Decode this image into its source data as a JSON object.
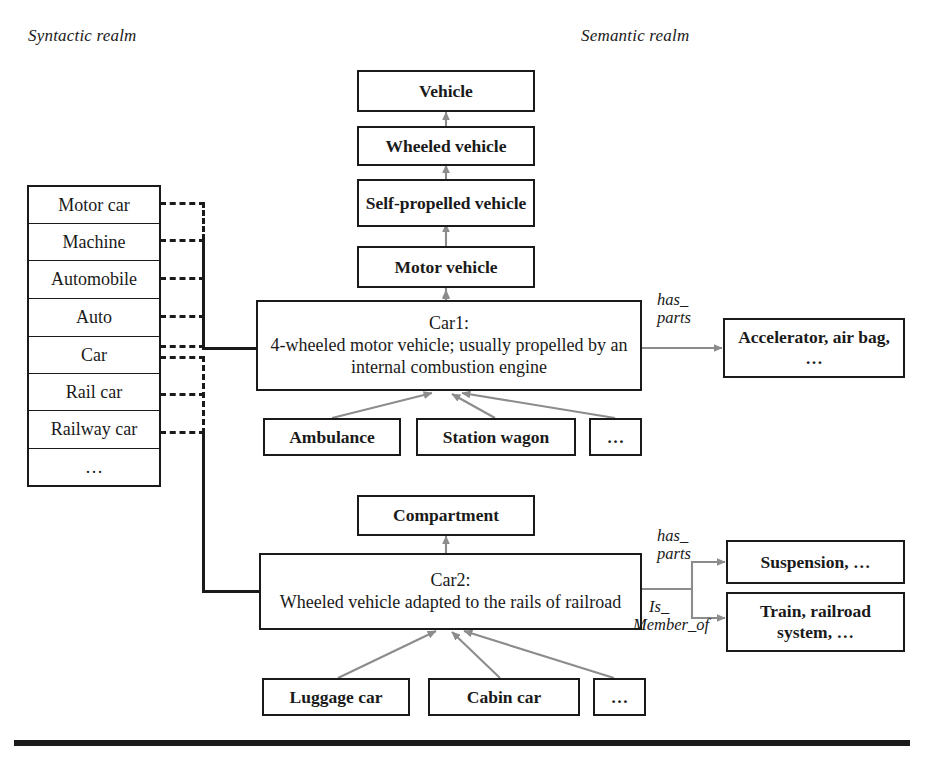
{
  "figure": {
    "headings": {
      "syntactic": "Syntactic realm",
      "semantic": "Semantic realm"
    }
  },
  "syntactic_table": {
    "rows": [
      {
        "label": "Motor car"
      },
      {
        "label": "Machine"
      },
      {
        "label": "Automobile"
      },
      {
        "label": "Auto"
      },
      {
        "label": "Car"
      },
      {
        "label": "Rail car"
      },
      {
        "label": "Railway car"
      },
      {
        "label": "…"
      }
    ]
  },
  "hierarchy": {
    "nodes": [
      {
        "label": "Vehicle"
      },
      {
        "label": "Wheeled vehicle"
      },
      {
        "label": "Self-propelled vehicle"
      },
      {
        "label": "Motor vehicle"
      }
    ]
  },
  "senses": {
    "car1": {
      "id": "Car1:",
      "gloss": "4-wheeled motor vehicle; usually propelled by an internal combustion engine",
      "hyponyms": [
        {
          "label": "Ambulance"
        },
        {
          "label": "Station wagon"
        },
        {
          "label": "…"
        }
      ],
      "relations": [
        {
          "name": "has_parts",
          "line1": "has_",
          "line2": "parts",
          "target": "Accelerator, air bag, …"
        }
      ]
    },
    "car2": {
      "id": "Car2:",
      "gloss": "Wheeled vehicle adapted to the rails of railroad",
      "meronym": {
        "label": "Compartment"
      },
      "hyponyms": [
        {
          "label": "Luggage car"
        },
        {
          "label": "Cabin car"
        },
        {
          "label": "…"
        }
      ],
      "relations": [
        {
          "name": "has_parts",
          "line1": "has_",
          "line2": "parts",
          "target": "Suspension, …"
        },
        {
          "name": "is_member_of",
          "line1": "Is_",
          "line2": "Member_of",
          "target": "Train, railroad system, …"
        }
      ]
    }
  },
  "colors": {
    "ink": "#1a1a1a",
    "arrow_grey": "#8c8c8c",
    "background": "#ffffff"
  }
}
